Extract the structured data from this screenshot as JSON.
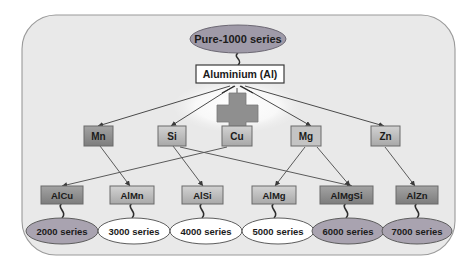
{
  "diagram": {
    "title_node": {
      "label": "Pure-1000 series",
      "shape": "ellipse",
      "fill": "#9f9aa8"
    },
    "base_node": {
      "label": "Aluminium (Al)",
      "shape": "rect",
      "fill": "#ffffff"
    },
    "operator": {
      "label": "+",
      "name": "plus-sign"
    },
    "alloying_elements": [
      {
        "label": "Mn",
        "fill": "#8a8a8a"
      },
      {
        "label": "Si",
        "fill": "#b4b4b4"
      },
      {
        "label": "Cu",
        "fill": "#b4b4b4"
      },
      {
        "label": "Mg",
        "fill": "#c2c2c2"
      },
      {
        "label": "Zn",
        "fill": "#b4b4b4"
      }
    ],
    "alloy_systems": [
      {
        "label": "AlCu",
        "fill": "#8d8d8d"
      },
      {
        "label": "AlMn",
        "fill": "#b6b6b6"
      },
      {
        "label": "AlSi",
        "fill": "#b6b6b6"
      },
      {
        "label": "AlMg",
        "fill": "#bdbdbd"
      },
      {
        "label": "AlMgSi",
        "fill": "#8d8d8d"
      },
      {
        "label": "AlZn",
        "fill": "#9a9a9a"
      }
    ],
    "series_nodes": [
      {
        "label": "2000 series",
        "fill": "#a9a3b0"
      },
      {
        "label": "3000 series",
        "fill": "#ffffff"
      },
      {
        "label": "4000 series",
        "fill": "#ffffff"
      },
      {
        "label": "5000 series",
        "fill": "#ffffff"
      },
      {
        "label": "6000 series",
        "fill": "#a9a3b0"
      },
      {
        "label": "7000 series",
        "fill": "#a9a3b0"
      }
    ],
    "colors": {
      "panel_fill": "#e9e9e9",
      "panel_border": "#9a9a9a",
      "line": "#4a4a4a",
      "text": "#1b1b1b"
    }
  }
}
